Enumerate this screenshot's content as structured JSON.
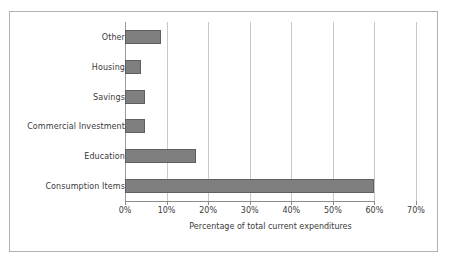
{
  "chart_data": {
    "type": "bar",
    "orientation": "horizontal",
    "title": "",
    "xlabel": "Percentage of total current expenditures",
    "ylabel": "",
    "categories": [
      "Other",
      "Housing",
      "Savings",
      "Commercial Investment",
      "Education",
      "Consumption Items"
    ],
    "values": [
      8.7,
      3.8,
      4.8,
      4.8,
      17,
      60
    ],
    "xlim": [
      0,
      70
    ],
    "xticks": [
      0,
      10,
      20,
      30,
      40,
      50,
      60,
      70
    ],
    "xtick_labels": [
      "0%",
      "10%",
      "20%",
      "30%",
      "40%",
      "50%",
      "60%",
      "70%"
    ],
    "grid": "vertical",
    "legend": "none",
    "bar_color": "#7f7f7f",
    "bar_edge_color": "#5f5f5f",
    "gridline_color": "#c8c8c8",
    "axis_color": "#8c8c8c",
    "border_color": "#b0b0b0",
    "background_color": "#ffffff",
    "text_color": "#3a3a3a"
  }
}
